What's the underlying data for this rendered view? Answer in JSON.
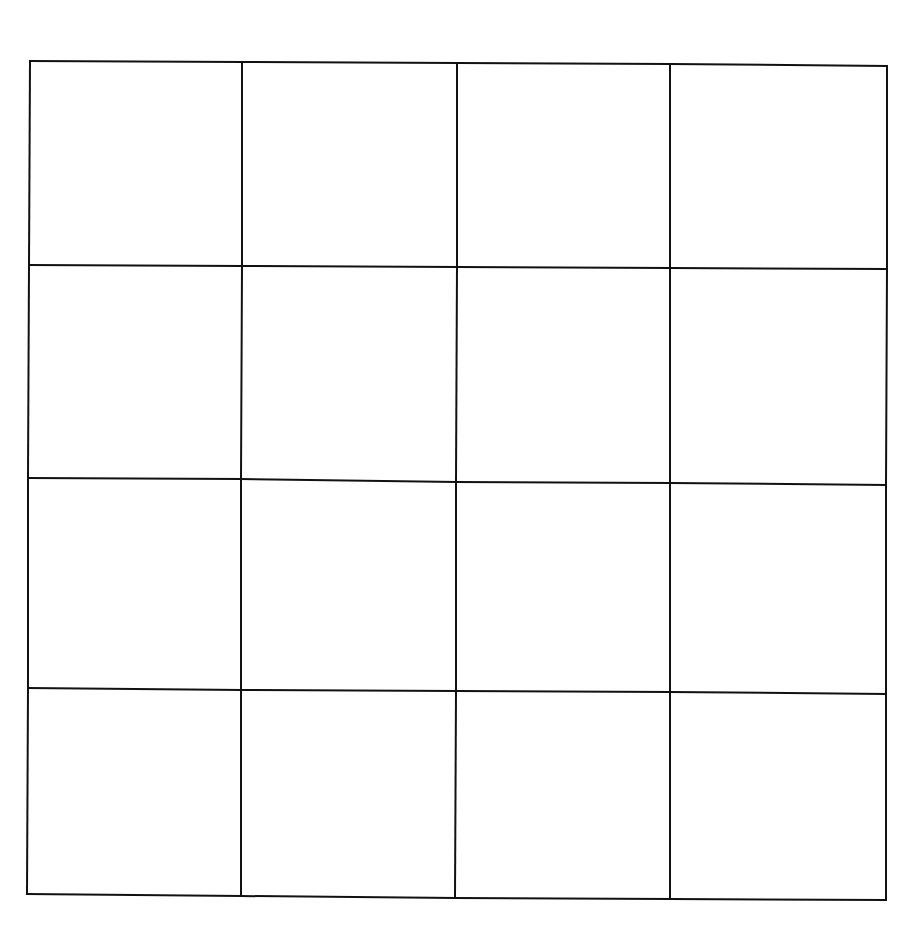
{
  "grid": {
    "rows": 4,
    "cols": 4,
    "line_color": "#111111",
    "background": "#ffffff",
    "row_lines": [
      [
        [
          30,
          61
        ],
        [
          242,
          62
        ],
        [
          457,
          63
        ],
        [
          670,
          64
        ],
        [
          887,
          66
        ]
      ],
      [
        [
          29,
          265
        ],
        [
          242,
          266
        ],
        [
          457,
          267
        ],
        [
          670,
          268
        ],
        [
          887,
          269
        ]
      ],
      [
        [
          28,
          478
        ],
        [
          241,
          479
        ],
        [
          456,
          482
        ],
        [
          670,
          483
        ],
        [
          886,
          485
        ]
      ],
      [
        [
          28,
          688
        ],
        [
          241,
          690
        ],
        [
          456,
          691
        ],
        [
          670,
          692
        ],
        [
          886,
          694
        ]
      ],
      [
        [
          27,
          894
        ],
        [
          241,
          896
        ],
        [
          455,
          898
        ],
        [
          670,
          899
        ],
        [
          886,
          900
        ]
      ]
    ],
    "cells": [
      [
        "",
        "",
        "",
        ""
      ],
      [
        "",
        "",
        "",
        ""
      ],
      [
        "",
        "",
        "",
        ""
      ],
      [
        "",
        "",
        "",
        ""
      ]
    ]
  }
}
